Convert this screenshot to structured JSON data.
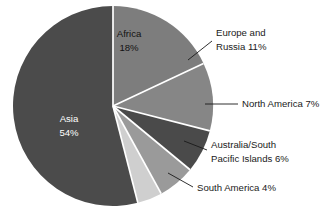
{
  "chart_data": {
    "type": "pie",
    "title": "",
    "subtitle": "",
    "xlabel": "",
    "ylabel": "",
    "legend_position": "none",
    "grid": false,
    "units": "percent",
    "total": 100,
    "start_angle_deg": 0,
    "direction": "clockwise",
    "categories": [
      "Africa",
      "Europe and Russia",
      "North America",
      "Australia/South Pacific Islands",
      "South America",
      "Asia"
    ],
    "values": [
      18,
      11,
      7,
      6,
      4,
      54
    ],
    "slices": [
      {
        "name": "Africa",
        "value": 18,
        "value_text": "18%",
        "label_line_1": "Africa",
        "label_line_2": "18%",
        "label_full": "Africa 18%",
        "color": "#7d7d7d",
        "label_placement": "inside",
        "label_color": "#121212"
      },
      {
        "name": "Europe and Russia",
        "value": 11,
        "value_text": "11%",
        "label_line_1": "Europe and",
        "label_line_2": "Russia 11%",
        "label_full": "Europe and Russia 11%",
        "color": "#868686",
        "label_placement": "outside-right",
        "label_color": "#1a1a1a"
      },
      {
        "name": "North America",
        "value": 7,
        "value_text": "7%",
        "label_line_1": "North America 7%",
        "label_line_2": "",
        "label_full": "North America 7%",
        "color": "#4a4a4a",
        "label_placement": "outside-right",
        "label_color": "#1a1a1a"
      },
      {
        "name": "Australia/South Pacific Islands",
        "value": 6,
        "value_text": "6%",
        "label_line_1": "Australia/South",
        "label_line_2": "Pacific Islands 6%",
        "label_full": "Australia/South Pacific Islands 6%",
        "color": "#9a9a9a",
        "label_placement": "outside-right",
        "label_color": "#1a1a1a"
      },
      {
        "name": "South America",
        "value": 4,
        "value_text": "4%",
        "label_line_1": "South America 4%",
        "label_line_2": "",
        "label_full": "South America 4%",
        "color": "#cfcfcf",
        "label_placement": "outside-right",
        "label_color": "#1a1a1a"
      },
      {
        "name": "Asia",
        "value": 54,
        "value_text": "54%",
        "label_line_1": "Asia",
        "label_line_2": "54%",
        "label_full": "Asia 54%",
        "color": "#4b4b4b",
        "label_placement": "inside",
        "label_color": "#ffffff"
      }
    ],
    "separator_color": "#ffffff",
    "background_color": "#ffffff"
  }
}
